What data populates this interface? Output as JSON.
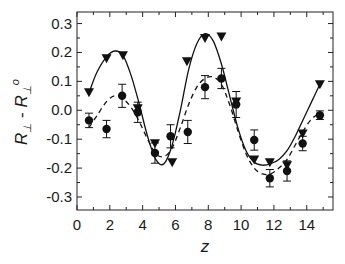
{
  "chart_data": {
    "type": "scatter",
    "title": "",
    "xlabel": "z",
    "ylabel": "R⊥ - R⊥°",
    "ylabel_parts": {
      "r1": "R",
      "sub1": "⊥",
      "minus": " - ",
      "r2": "R",
      "sub2": "⊥",
      "sup2": "o"
    },
    "xlim": [
      0,
      15.6
    ],
    "ylim": [
      -0.345,
      0.34
    ],
    "xticks": [
      0,
      2,
      4,
      6,
      8,
      10,
      12,
      14
    ],
    "yticks": [
      0.3,
      0.2,
      0.1,
      0.0,
      -0.1,
      -0.2,
      -0.3
    ],
    "ytick_labels": [
      "0.3",
      "0.2",
      "0.1",
      "0.0",
      "-0.1",
      "-0.2",
      "-0.3"
    ],
    "grid": false,
    "legend": null,
    "series": [
      {
        "name": "triangles",
        "marker": "triangle-down",
        "line": "solid",
        "x": [
          0.73,
          1.8,
          2.8,
          3.7,
          4.75,
          5.8,
          6.7,
          7.8,
          8.8,
          9.7,
          10.8,
          11.75,
          12.8,
          13.75,
          14.8
        ],
        "y": [
          0.062,
          0.18,
          0.19,
          0.007,
          -0.114,
          -0.18,
          0.17,
          0.25,
          0.255,
          0.03,
          -0.17,
          -0.18,
          -0.19,
          -0.08,
          0.09
        ]
      },
      {
        "name": "circles",
        "marker": "circle",
        "line": "dashed",
        "x": [
          0.73,
          1.8,
          2.75,
          3.7,
          4.75,
          5.7,
          6.75,
          7.8,
          8.8,
          9.7,
          10.8,
          11.75,
          12.8,
          13.75,
          14.8
        ],
        "y": [
          -0.035,
          -0.065,
          0.05,
          -0.007,
          -0.148,
          -0.09,
          -0.075,
          0.08,
          0.11,
          0.02,
          -0.103,
          -0.235,
          -0.21,
          -0.115,
          -0.017
        ],
        "yerr": [
          0.025,
          0.03,
          0.04,
          0.035,
          0.035,
          0.04,
          0.04,
          0.04,
          0.035,
          0.045,
          0.035,
          0.03,
          0.035,
          0.025,
          0.015
        ]
      }
    ],
    "fits": [
      {
        "name": "solid-fit",
        "style": "solid",
        "x": [
          0.73,
          1.2,
          1.8,
          2.3,
          2.8,
          3.3,
          3.8,
          4.3,
          4.8,
          5.3,
          5.8,
          6.3,
          6.8,
          7.3,
          7.8,
          8.3,
          8.8,
          9.3,
          9.8,
          10.3,
          10.8,
          11.3,
          11.8,
          12.3,
          12.8,
          13.3,
          13.8,
          14.3,
          14.8
        ],
        "y": [
          0.06,
          0.13,
          0.185,
          0.205,
          0.19,
          0.12,
          0.02,
          -0.09,
          -0.17,
          -0.185,
          -0.12,
          0.0,
          0.14,
          0.23,
          0.265,
          0.24,
          0.16,
          0.05,
          -0.06,
          -0.14,
          -0.18,
          -0.19,
          -0.185,
          -0.17,
          -0.14,
          -0.09,
          -0.03,
          0.03,
          0.09
        ]
      },
      {
        "name": "dashed-fit",
        "style": "dashed",
        "x": [
          0.73,
          1.2,
          1.8,
          2.3,
          2.8,
          3.3,
          3.8,
          4.3,
          4.8,
          5.3,
          5.8,
          6.3,
          6.8,
          7.3,
          7.8,
          8.3,
          8.8,
          9.3,
          9.8,
          10.3,
          10.8,
          11.3,
          11.8,
          12.3,
          12.8,
          13.3,
          13.8,
          14.3,
          14.8
        ],
        "y": [
          -0.06,
          -0.02,
          0.03,
          0.05,
          0.04,
          0.01,
          -0.04,
          -0.1,
          -0.15,
          -0.16,
          -0.13,
          -0.06,
          0.02,
          0.08,
          0.11,
          0.115,
          0.09,
          0.02,
          -0.07,
          -0.15,
          -0.2,
          -0.22,
          -0.22,
          -0.2,
          -0.17,
          -0.12,
          -0.07,
          -0.03,
          -0.01
        ]
      }
    ]
  }
}
